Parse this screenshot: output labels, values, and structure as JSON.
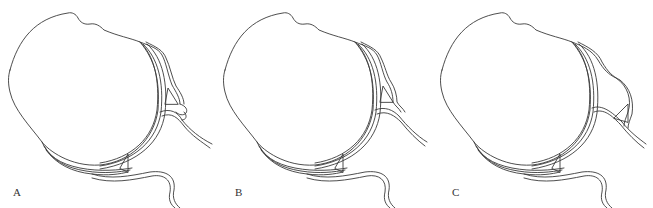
{
  "figure": {
    "panels": [
      {
        "id": "A",
        "label": "A",
        "variant": "notched-double-bulge"
      },
      {
        "id": "B",
        "label": "B",
        "variant": "stepped-wavy"
      },
      {
        "id": "C",
        "label": "C",
        "variant": "large-rounded-bulge"
      }
    ],
    "stroke_color": "#3a3a3a",
    "background": "#ffffff"
  }
}
